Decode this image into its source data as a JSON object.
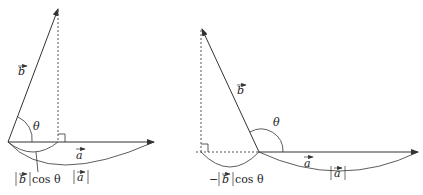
{
  "diagrams": [
    {
      "name": "acute-angle-projection",
      "labels": {
        "vec_b": "b",
        "vec_a": "a",
        "theta": "θ",
        "projection": "cos θ",
        "projection_bars_vec": "b",
        "magnitude_a": "a"
      }
    },
    {
      "name": "obtuse-angle-projection",
      "labels": {
        "vec_b": "b",
        "vec_a": "a",
        "theta": "θ",
        "neg_sign": "−",
        "projection": "cos θ",
        "projection_bars_vec": "b",
        "magnitude_a": "a"
      }
    }
  ],
  "colors": {
    "stroke": "#333333",
    "background": "#ffffff"
  }
}
